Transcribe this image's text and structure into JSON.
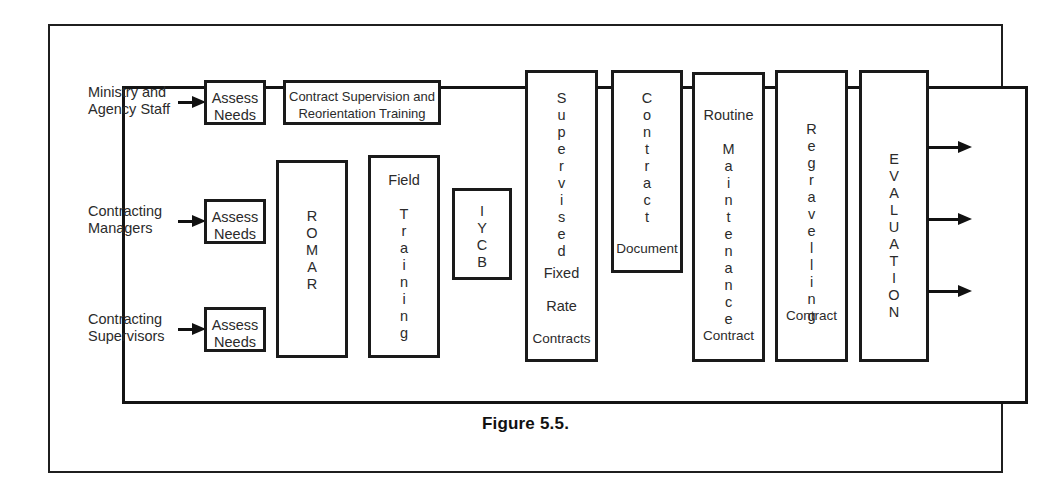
{
  "figure": {
    "caption": "Figure 5.5."
  },
  "inputs": [
    {
      "label": "Ministry and\nAgency Staff",
      "arrow": "arrow-right-icon",
      "target": "Assess\nNeeds"
    },
    {
      "label": "Contracting\nManagers",
      "arrow": "arrow-right-icon",
      "target": "Assess\nNeeds"
    },
    {
      "label": "Contracting\nSupervisors",
      "arrow": "arrow-right-icon",
      "target": "Assess\nNeeds"
    }
  ],
  "assess_boxes": [
    {
      "text": "Assess\nNeeds"
    },
    {
      "text": "Assess\nNeeds"
    },
    {
      "text": "Assess\nNeeds"
    }
  ],
  "training_box": {
    "line1": "Contract Supervision and",
    "line2": "Reorientation Training"
  },
  "process_boxes": [
    {
      "name": "romar",
      "vertical_text": "ROMAR",
      "top_text": "",
      "bottom_lines": []
    },
    {
      "name": "field-training",
      "vertical_text": "Training",
      "top_text": "Field",
      "bottom_lines": []
    },
    {
      "name": "iycb",
      "vertical_text": "IYCB",
      "top_text": "",
      "bottom_lines": []
    },
    {
      "name": "supervised-fixed-rate-contracts",
      "vertical_text": "Supervised",
      "top_text": "",
      "bottom_lines": [
        "Fixed",
        "Rate",
        "Contracts"
      ]
    },
    {
      "name": "contract-document",
      "vertical_text": "Contract",
      "top_text": "",
      "bottom_lines": [
        "Document"
      ]
    },
    {
      "name": "routine-maintenance-contract",
      "vertical_text": "Maintenance",
      "top_text": "Routine",
      "bottom_lines": [
        "Contract"
      ]
    },
    {
      "name": "regravelling-contract",
      "vertical_text": "Regravelling",
      "top_text": "",
      "bottom_lines": [
        "Contract"
      ]
    },
    {
      "name": "evaluation",
      "vertical_text": "EVALUATION",
      "top_text": "",
      "bottom_lines": []
    }
  ],
  "output_arrows": [
    {
      "name": "evaluation-output-arrow-1"
    },
    {
      "name": "evaluation-output-arrow-2"
    },
    {
      "name": "evaluation-output-arrow-3"
    }
  ],
  "colors": {
    "line": "#1a1a1a",
    "text": "#2b2b2b",
    "background": "#ffffff"
  }
}
